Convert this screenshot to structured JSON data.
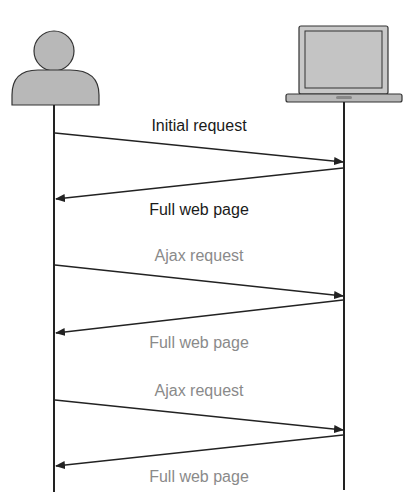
{
  "actors": {
    "client": {
      "icon": "user-icon",
      "fill": "#b8b8b8"
    },
    "server": {
      "icon": "laptop-icon",
      "fill": "#c4c4c4"
    }
  },
  "messages": [
    {
      "label": "Initial request",
      "direction": "client-to-server",
      "color": "#1a1a1a"
    },
    {
      "label": "Full web page",
      "direction": "server-to-client",
      "color": "#1a1a1a"
    },
    {
      "label": "Ajax request",
      "direction": "client-to-server",
      "color": "#8a8a8a"
    },
    {
      "label": "Full web page",
      "direction": "server-to-client",
      "color": "#8a8a8a"
    },
    {
      "label": "Ajax request",
      "direction": "client-to-server",
      "color": "#8a8a8a"
    },
    {
      "label": "Full web page",
      "direction": "server-to-client",
      "color": "#8a8a8a"
    }
  ]
}
